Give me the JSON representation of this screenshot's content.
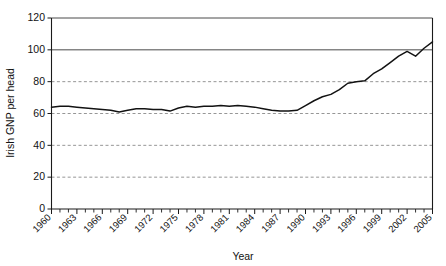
{
  "chart_data": {
    "type": "line",
    "title": "",
    "xlabel": "Year",
    "ylabel": "Irish GNP per head",
    "xlim": [
      1960,
      2005
    ],
    "ylim": [
      0,
      120
    ],
    "grid": true,
    "legend": "none",
    "y_ticks": [
      0,
      20,
      40,
      60,
      80,
      100,
      120
    ],
    "y_tick_labels": [
      "0",
      "20",
      "40",
      "60",
      "80",
      "100",
      "120"
    ],
    "x_ticks": [
      1960,
      1963,
      1966,
      1969,
      1972,
      1975,
      1978,
      1981,
      1984,
      1987,
      1990,
      1993,
      1996,
      1999,
      2002,
      2005
    ],
    "x_tick_labels": [
      "1960",
      "1963",
      "1966",
      "1969",
      "1972",
      "1975",
      "1978",
      "1981",
      "1984",
      "1987",
      "1990",
      "1993",
      "1996",
      "1999",
      "2002",
      "2005"
    ],
    "x_minor_tick_interval": 1,
    "series": [
      {
        "name": "Irish GNP per head",
        "color": "#121212",
        "x": [
          1960,
          1961,
          1962,
          1963,
          1964,
          1965,
          1966,
          1967,
          1968,
          1969,
          1970,
          1971,
          1972,
          1973,
          1974,
          1975,
          1976,
          1977,
          1978,
          1979,
          1980,
          1981,
          1982,
          1983,
          1984,
          1985,
          1986,
          1987,
          1988,
          1989,
          1990,
          1991,
          1992,
          1993,
          1994,
          1995,
          1996,
          1997,
          1998,
          1999,
          2000,
          2001,
          2002,
          2003,
          2004,
          2005
        ],
        "values": [
          64,
          64.5,
          64.5,
          64,
          63.5,
          63,
          62.5,
          62,
          61,
          62,
          63,
          63,
          62.5,
          62.5,
          61.5,
          63.5,
          64.5,
          64,
          64.5,
          64.5,
          65,
          64.5,
          65,
          64.5,
          64,
          63,
          62,
          61.5,
          61.5,
          62,
          65,
          68,
          70.5,
          72,
          75,
          79,
          80,
          80.5,
          85,
          88,
          92,
          96,
          99,
          96,
          101,
          105
        ]
      }
    ]
  },
  "axis": {
    "y_title": "Irish GNP per head",
    "x_title": "Year"
  }
}
